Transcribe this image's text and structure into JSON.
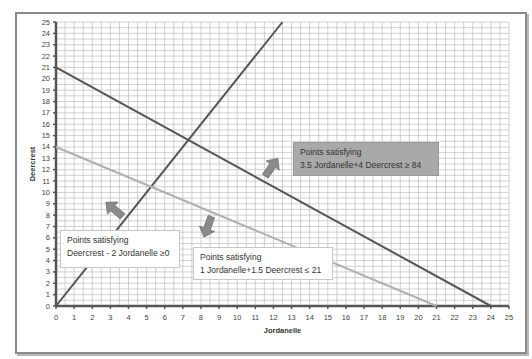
{
  "chart_data": {
    "type": "line",
    "title": "",
    "xlabel": "Jordanelle",
    "ylabel": "Deercrest",
    "xlim": [
      0,
      25
    ],
    "ylim": [
      0,
      25
    ],
    "xticks": [
      0,
      1,
      2,
      3,
      4,
      5,
      6,
      7,
      8,
      9,
      10,
      11,
      12,
      13,
      14,
      15,
      16,
      17,
      18,
      19,
      20,
      21,
      22,
      23,
      24,
      25
    ],
    "yticks": [
      0,
      1,
      2,
      3,
      4,
      5,
      6,
      7,
      8,
      9,
      10,
      11,
      12,
      13,
      14,
      15,
      16,
      17,
      18,
      19,
      20,
      21,
      22,
      23,
      24,
      25
    ],
    "grid": true,
    "series": [
      {
        "name": "Deercrest - 2 Jordanelle = 0",
        "color": "#555555",
        "points": [
          [
            0,
            0
          ],
          [
            12.5,
            25
          ]
        ]
      },
      {
        "name": "3.5 Jordanelle + 4 Deercrest = 84",
        "color": "#555555",
        "points": [
          [
            0,
            21
          ],
          [
            24,
            0
          ]
        ]
      },
      {
        "name": "1 Jordanelle + 1.5 Deercrest = 21",
        "color": "#b0b0b0",
        "points": [
          [
            0,
            14
          ],
          [
            21,
            0
          ]
        ]
      }
    ],
    "annotations": [
      {
        "id": "c1",
        "line1": "Points satisfying",
        "line2": "Deercrest - 2 Jordanelle ≥0"
      },
      {
        "id": "c2",
        "line1": "Points satisfying",
        "line2": "1 Jordanelle+1.5 Deercrest ≤ 21"
      },
      {
        "id": "c3",
        "line1": "Points satisfying",
        "line2": "3.5 Jordanelle+4 Deercrest ≥ 84"
      }
    ]
  },
  "colors": {
    "grid": "#bdbdbd",
    "axis": "#555555",
    "dark_line": "#555555",
    "light_line": "#b0b0b0",
    "arrow": "#8a8a8a"
  }
}
